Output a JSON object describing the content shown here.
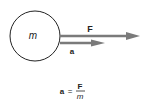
{
  "diagram": {
    "mass_label": "m",
    "force_label": "F",
    "accel_label": "a",
    "equation": {
      "lhs": "a",
      "equals": "=",
      "numerator": "F",
      "denominator": "m"
    },
    "colors": {
      "arrow": "#7a7a7a",
      "circle_stroke": "#222222",
      "text": "#222222"
    }
  }
}
